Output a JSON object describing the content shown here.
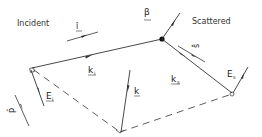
{
  "title_labels": {
    "incident": "Incident",
    "scattered": "Scattered"
  },
  "vectors": {
    "i_hat": {
      "symbol": "î",
      "label": "I"
    },
    "s_hat": {
      "symbol": "ŝ",
      "label": "s"
    },
    "beta": {
      "symbol": "β"
    },
    "k_i": {
      "symbol": "k",
      "subscript": "i"
    },
    "k_s": {
      "symbol": "k",
      "subscript": "s"
    },
    "k": {
      "symbol": "k"
    },
    "E_i": {
      "symbol": "E",
      "subscript": "i"
    },
    "E_s": {
      "symbol": "E",
      "subscript": "s"
    },
    "p_hat": {
      "symbol": "p̂",
      "label": "p"
    }
  },
  "colors": {
    "line": "#333333",
    "text": "#222222",
    "background": "#ffffff"
  }
}
